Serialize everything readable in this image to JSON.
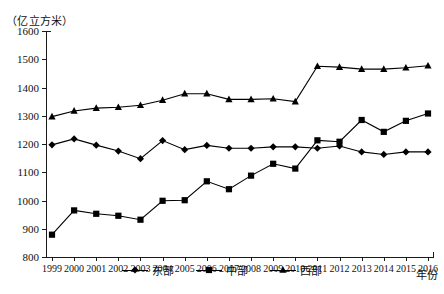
{
  "chart_data": {
    "type": "line",
    "title": "",
    "subtitle": "",
    "xlabel": "年份",
    "ylabel": "（亿立方米）",
    "y_unit_caption": "（亿立方米）",
    "grid": false,
    "legend_position": "bottom-center",
    "categories": [
      "1999",
      "2000",
      "2001",
      "2002",
      "2003",
      "2004",
      "2005",
      "2006",
      "2007",
      "2008",
      "2009",
      "2010",
      "2011",
      "2012",
      "2013",
      "2014",
      "2015",
      "2016"
    ],
    "x": [
      1999,
      2000,
      2001,
      2002,
      2003,
      2004,
      2005,
      2006,
      2007,
      2008,
      2009,
      2010,
      2011,
      2012,
      2013,
      2014,
      2015,
      2016
    ],
    "xlim": [
      1999,
      2016
    ],
    "ylim": [
      800,
      1600
    ],
    "ytick_labels": [
      "1600",
      "1500",
      "1400",
      "1300",
      "1200",
      "1100",
      "1000",
      "900",
      "800"
    ],
    "yticks": [
      1600,
      1500,
      1400,
      1300,
      1200,
      1100,
      1000,
      900,
      800
    ],
    "series": [
      {
        "name": "东部",
        "marker": "diamond",
        "values": [
          1197,
          1218,
          1196,
          1175,
          1148,
          1212,
          1180,
          1195,
          1185,
          1185,
          1190,
          1190,
          1185,
          1193,
          1172,
          1163,
          1172,
          1172
        ]
      },
      {
        "name": "中部",
        "marker": "square",
        "values": [
          879,
          965,
          953,
          946,
          932,
          999,
          1001,
          1068,
          1040,
          1088,
          1130,
          1113,
          1213,
          1208,
          1285,
          1243,
          1282,
          1308
        ]
      },
      {
        "name": "西部",
        "marker": "triangle",
        "values": [
          1297,
          1317,
          1327,
          1330,
          1337,
          1355,
          1378,
          1378,
          1358,
          1358,
          1360,
          1350,
          1475,
          1472,
          1465,
          1465,
          1470,
          1477
        ]
      }
    ]
  },
  "legend": {
    "items": [
      {
        "label": "东部",
        "marker": "diamond-marker-icon"
      },
      {
        "label": "中部",
        "marker": "square-marker-icon"
      },
      {
        "label": "西部",
        "marker": "triangle-marker-icon"
      }
    ]
  },
  "axis": {
    "x_title": "年份",
    "y_unit": "（亿立方米）"
  }
}
